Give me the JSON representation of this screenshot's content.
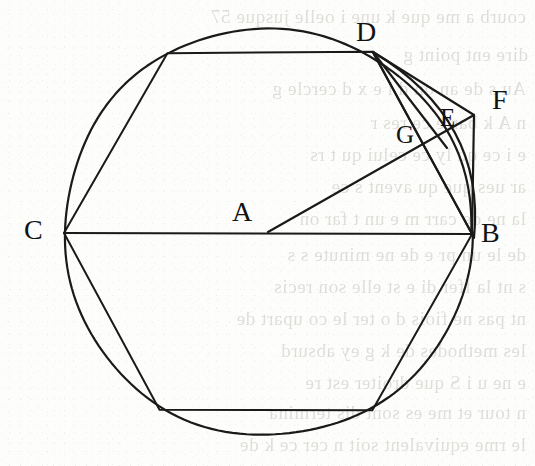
{
  "figure": {
    "kind": "euclidean-geometry-diagram",
    "canvas": {
      "width": 535,
      "height": 466
    },
    "stroke_color": "#1a1a1a",
    "background_color": "#fdfdfb",
    "ghost_text_color": "#6b665e"
  },
  "circle": {
    "name": "main-circle",
    "center_label": "A",
    "cx": 268,
    "cy": 232,
    "r": 204,
    "stroke_width": 2.2
  },
  "points": [
    {
      "id": "A",
      "label": "A",
      "x": 268,
      "y": 232,
      "label_x": 232,
      "label_y": 198,
      "size": "lbl-lg",
      "role": "circle-center"
    },
    {
      "id": "B",
      "label": "B",
      "x": 472,
      "y": 234,
      "label_x": 481,
      "label_y": 219,
      "size": "lbl-lg",
      "role": "circle-point-right"
    },
    {
      "id": "C",
      "label": "C",
      "x": 64,
      "y": 233,
      "label_x": 24,
      "label_y": 216,
      "size": "lbl-lg",
      "role": "circle-point-left"
    },
    {
      "id": "D",
      "label": "D",
      "x": 373,
      "y": 52,
      "label_x": 356,
      "label_y": 18,
      "size": "lbl-lg",
      "role": "hexagon-vertex-upper-right"
    },
    {
      "id": "E",
      "label": "E",
      "x": 443,
      "y": 135,
      "label_x": 440,
      "label_y": 105,
      "size": "lbl-md",
      "role": "intersection-point"
    },
    {
      "id": "F",
      "label": "F",
      "x": 474,
      "y": 115,
      "label_x": 492,
      "label_y": 86,
      "size": "lbl-lg",
      "role": "outer-point"
    },
    {
      "id": "G",
      "label": "G",
      "x": 414,
      "y": 146,
      "label_x": 396,
      "label_y": 122,
      "size": "lbl-md",
      "role": "intersection-point"
    }
  ],
  "hexagon": {
    "name": "inscribed-hexagon",
    "vertices": [
      {
        "x": 64,
        "y": 233
      },
      {
        "x": 167,
        "y": 53
      },
      {
        "x": 373,
        "y": 52
      },
      {
        "x": 472,
        "y": 234
      },
      {
        "x": 372,
        "y": 410
      },
      {
        "x": 160,
        "y": 410
      }
    ],
    "stroke_width": 2.0
  },
  "segments": [
    {
      "name": "segment-C-B",
      "from": "C",
      "to": "B",
      "x1": 64,
      "y1": 233,
      "x2": 472,
      "y2": 234,
      "stroke_width": 2.0
    },
    {
      "name": "segment-A-F",
      "from": "A",
      "to": "F",
      "x1": 268,
      "y1": 232,
      "x2": 474,
      "y2": 115,
      "stroke_width": 2.2
    },
    {
      "name": "segment-D-F",
      "from": "D",
      "to": "F",
      "x1": 373,
      "y1": 52,
      "x2": 474,
      "y2": 115,
      "stroke_width": 2.2
    },
    {
      "name": "segment-D-E",
      "from": "D",
      "to": "E",
      "x1": 373,
      "y1": 52,
      "x2": 447,
      "y2": 148,
      "stroke_width": 2.2
    },
    {
      "name": "segment-D-B",
      "from": "D",
      "to": "B",
      "x1": 373,
      "y1": 52,
      "x2": 472,
      "y2": 234,
      "stroke_width": 2.2
    },
    {
      "name": "segment-F-B",
      "from": "F",
      "to": "B",
      "x1": 474,
      "y1": 115,
      "x2": 472,
      "y2": 234,
      "stroke_width": 2.2
    }
  ],
  "arcs": [
    {
      "name": "arc-D-to-B",
      "from": "D",
      "to": "B",
      "description": "circular arc bulging right from D to B",
      "stroke_width": 2.2
    }
  ],
  "ghost_text": {
    "description": "faint mirrored bleed-through text from the reverse page of the scan",
    "lines": [
      {
        "text": "courb  a  me que k  une  i  oelle jusque 57",
        "x": 6,
        "y": 6,
        "size": 19
      },
      {
        "text": "dire      ent point g",
        "x": 8,
        "y": 44,
        "size": 19
      },
      {
        "text": "Au s de an   on d  l    e  x   d   cercle  g",
        "x": 6,
        "y": 78,
        "size": 19
      },
      {
        "text": "n    A         k          barre   ce  res   r",
        "x": 6,
        "y": 112,
        "size": 19
      },
      {
        "text": "e     i     ce qu   ly  ce  celui  qu   t  rs",
        "x": 6,
        "y": 144,
        "size": 19
      },
      {
        "text": "ar  ues      que  qu      avent  s   ce",
        "x": 6,
        "y": 176,
        "size": 19
      },
      {
        "text": "la  ne de  carr      m   e  un   t far  on",
        "x": 6,
        "y": 208,
        "size": 19
      },
      {
        "text": "de  le  un pr   e de  ne minute  s   s",
        "x": 6,
        "y": 244,
        "size": 19
      },
      {
        "text": "s  nt la  ffer di     e  st   elle son recis",
        "x": 6,
        "y": 276,
        "size": 19
      },
      {
        "text": "nt  pas  ne fiois d o  ter le  co     upart  de",
        "x": 6,
        "y": 308,
        "size": 19
      },
      {
        "text": "les  methodes  de  k     g     ey    absurd",
        "x": 6,
        "y": 340,
        "size": 19
      },
      {
        "text": "e   ne  u     i  S   que  droiter   est  re",
        "x": 6,
        "y": 372,
        "size": 19
      },
      {
        "text": "n  tour  et   me   es  sont  dis     termina",
        "x": 6,
        "y": 402,
        "size": 19
      },
      {
        "text": "le   rme  equivalent   soit  n cer  ce  k   de",
        "x": 6,
        "y": 434,
        "size": 19
      }
    ]
  }
}
